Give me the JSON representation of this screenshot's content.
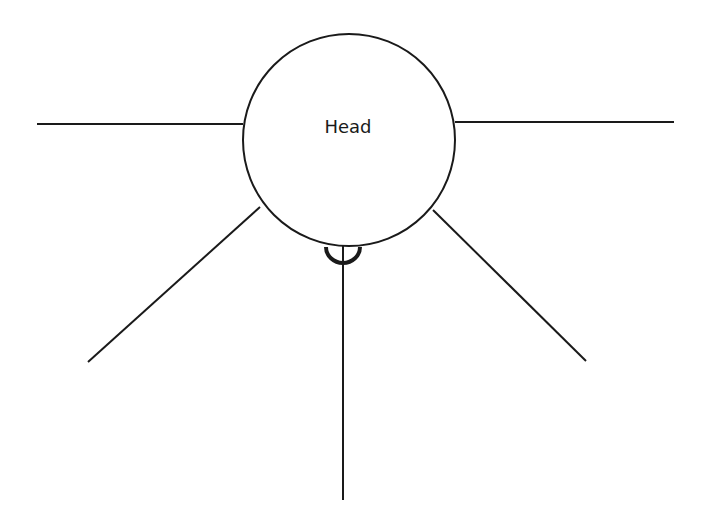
{
  "diagram": {
    "title": "",
    "stroke_color": "#1a1a1a",
    "background": "#ffffff",
    "head": {
      "label": "Head",
      "center": [
        349,
        140
      ],
      "radius": 106
    },
    "connector": {
      "type": "socket-semicircle",
      "center": [
        343,
        248
      ],
      "radius": 17
    },
    "lines": [
      {
        "name": "left-horizontal",
        "from": [
          243,
          124
        ],
        "to": [
          37,
          124
        ]
      },
      {
        "name": "right-horizontal",
        "from": [
          455,
          122
        ],
        "to": [
          674,
          122
        ]
      },
      {
        "name": "lower-left-diagonal",
        "from": [
          260,
          207
        ],
        "to": [
          88,
          362
        ]
      },
      {
        "name": "lower-right-diagonal",
        "from": [
          433,
          210
        ],
        "to": [
          586,
          361
        ]
      },
      {
        "name": "bottom-vertical",
        "from": [
          343,
          248
        ],
        "to": [
          343,
          500
        ]
      }
    ]
  }
}
